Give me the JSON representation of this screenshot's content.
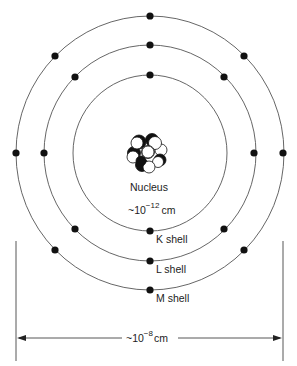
{
  "diagram": {
    "nucleus": {
      "label": "Nucleus",
      "size_prefix": "~10",
      "size_exponent": "−12",
      "size_unit": "cm"
    },
    "shells": [
      {
        "name": "K",
        "label": "K shell",
        "radius": 78,
        "electrons": 2
      },
      {
        "name": "L",
        "label": "L shell",
        "radius": 108,
        "electrons": 8
      },
      {
        "name": "M",
        "label": "M shell",
        "radius": 137,
        "electrons": 6
      }
    ],
    "dimension": {
      "prefix": "~10",
      "exponent": "−8",
      "unit": "cm"
    },
    "colors": {
      "line": "#444444",
      "electron": "#111111",
      "nucleon_dark": "#111111",
      "nucleon_light": "#ffffff"
    }
  }
}
